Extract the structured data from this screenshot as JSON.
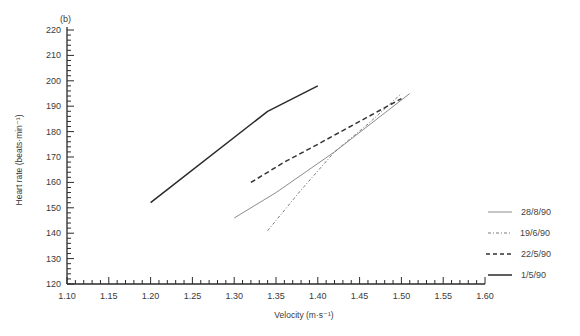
{
  "chart_data": {
    "type": "line",
    "panel_label": "(b)",
    "title": "",
    "xlabel": "Velocity (m·s⁻¹)",
    "ylabel": "Heart rate (beats·min⁻¹)",
    "xlim": [
      1.1,
      1.6
    ],
    "ylim": [
      120,
      220
    ],
    "x_ticks": [
      "1.10",
      "1.15",
      "1.20",
      "1.25",
      "1.30",
      "1.35",
      "1.40",
      "1.45",
      "1.50",
      "1.55",
      "1.60"
    ],
    "y_ticks": [
      "120",
      "130",
      "140",
      "150",
      "160",
      "170",
      "180",
      "190",
      "200",
      "210",
      "220"
    ],
    "x_minor_step": 0.01,
    "y_minor_step": 2,
    "grid": false,
    "legend_position": "bottom-right (outside plot)",
    "series": [
      {
        "name": "28/8/90",
        "style": "solid-thin",
        "color": "#8c8c8c",
        "points": [
          [
            1.3,
            146
          ],
          [
            1.35,
            156
          ],
          [
            1.42,
            172
          ],
          [
            1.51,
            195
          ]
        ]
      },
      {
        "name": "19/6/90",
        "style": "dash-dot",
        "color": "#7a7a7a",
        "points": [
          [
            1.34,
            141
          ],
          [
            1.38,
            157
          ],
          [
            1.42,
            172
          ],
          [
            1.46,
            183
          ],
          [
            1.5,
            195
          ]
        ]
      },
      {
        "name": "22/5/90",
        "style": "dashed",
        "color": "#333333",
        "points": [
          [
            1.32,
            160
          ],
          [
            1.36,
            168
          ],
          [
            1.4,
            175
          ],
          [
            1.45,
            184
          ],
          [
            1.5,
            193
          ]
        ]
      },
      {
        "name": "1/5/90",
        "style": "solid",
        "color": "#2a2a2a",
        "points": [
          [
            1.2,
            152
          ],
          [
            1.34,
            188
          ],
          [
            1.4,
            198
          ]
        ]
      }
    ]
  }
}
